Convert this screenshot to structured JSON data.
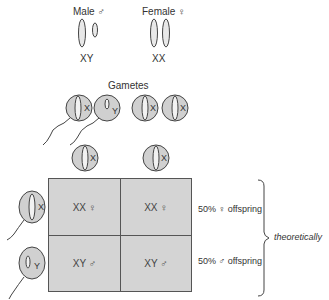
{
  "parents": {
    "male": {
      "label": "Male ♂",
      "genotype": "XY"
    },
    "female": {
      "label": "Female ♀",
      "genotype": "XX"
    }
  },
  "gametes": {
    "title": "Gametes",
    "sperm": [
      {
        "chromosome": "X"
      },
      {
        "chromosome": "Y"
      }
    ],
    "eggs": [
      {
        "chromosome": "X"
      },
      {
        "chromosome": "X"
      }
    ]
  },
  "punnett": {
    "columns": [
      "X",
      "X"
    ],
    "rows": [
      "X",
      "Y"
    ],
    "cells": [
      [
        "XX ♀",
        "XX ♀"
      ],
      [
        "XY ♂",
        "XY ♂"
      ]
    ]
  },
  "outcomes": {
    "female": "50% ♀ offspring",
    "male": "50% ♂ offspring",
    "note": "theoretically"
  },
  "colors": {
    "cell_fill": "#d4d4d4",
    "line": "#555555"
  }
}
